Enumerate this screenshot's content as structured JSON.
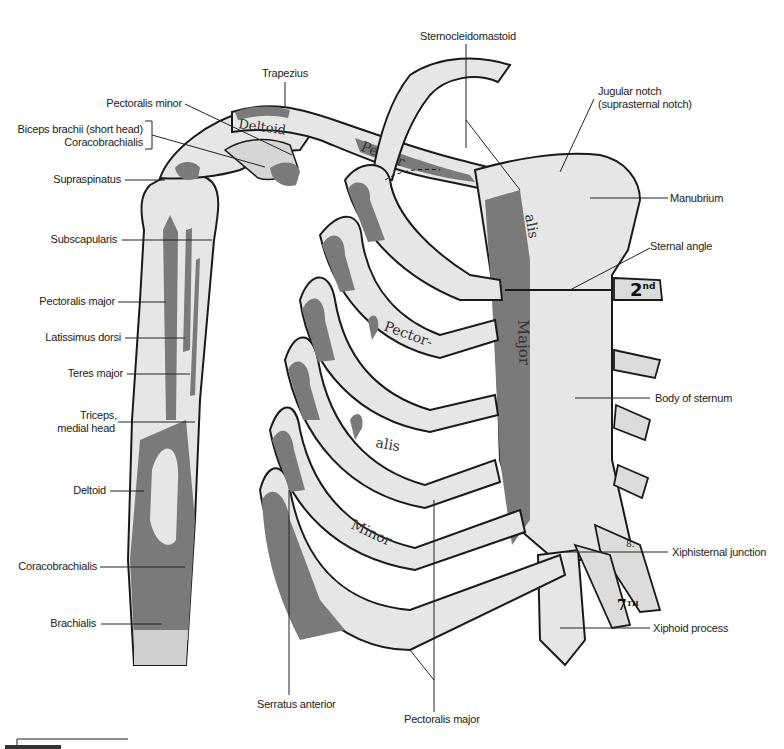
{
  "figure": {
    "colors": {
      "bone": "#e6e6e6",
      "bone_shade": "#d2d2d2",
      "muscle": "#7a7a7a",
      "outline": "#1a1a1a",
      "leader": "#222222"
    }
  },
  "labels_left": [
    {
      "text": "Pectoralis minor"
    },
    {
      "text": "Biceps brachii (short head)"
    },
    {
      "text": "Coracobrachialis"
    },
    {
      "text": "Supraspinatus"
    },
    {
      "text": "Subscapularis"
    },
    {
      "text": "Pectoralis major"
    },
    {
      "text": "Latissimus dorsi"
    },
    {
      "text": "Teres major"
    },
    {
      "text": "Triceps,"
    },
    {
      "text": "medial head"
    },
    {
      "text": "Deltoid"
    },
    {
      "text": "Coracobrachialis"
    },
    {
      "text": "Brachialis"
    }
  ],
  "labels_top": [
    {
      "text": "Trapezius"
    },
    {
      "text": "Sternocleidomastoid"
    }
  ],
  "labels_right": [
    {
      "text": "Jugular notch"
    },
    {
      "text": "(suprasternal notch)"
    },
    {
      "text": "Manubrium"
    },
    {
      "text": "Sternal angle"
    },
    {
      "text": "Body of sternum"
    },
    {
      "text": "Xiphisternal junction"
    },
    {
      "text": "Xiphoid process"
    }
  ],
  "labels_bottom": [
    {
      "text": "Serratus anterior"
    },
    {
      "text": "Pectoralis major"
    }
  ],
  "in_figure_text": {
    "deltoid_on_clavicle": "Deltoid",
    "pector_on_clavicle": "Pector",
    "alis_on_sternum": "alis",
    "major_on_sternum": "Major",
    "pector_rib": "Pector-",
    "alis_rib": "alis",
    "minor_rib": "Minor",
    "rib_2nd": "2",
    "rib_2nd_sup": "nd",
    "rib_7th": "7",
    "rib_7th_sup": "TH",
    "rib_8": "8."
  }
}
